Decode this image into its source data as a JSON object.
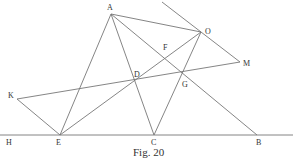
{
  "figure": {
    "caption": "Fig. 20",
    "points": [
      {
        "name": "A",
        "x": 111,
        "y": 14,
        "lx": 107,
        "ly": 10
      },
      {
        "name": "O",
        "x": 201,
        "y": 32,
        "lx": 205,
        "ly": 34
      },
      {
        "name": "F",
        "x": 166,
        "y": 52,
        "lx": 163,
        "ly": 50
      },
      {
        "name": "M",
        "x": 240,
        "y": 62,
        "lx": 243,
        "ly": 66
      },
      {
        "name": "D",
        "x": 135,
        "y": 80,
        "lx": 134,
        "ly": 77
      },
      {
        "name": "G",
        "x": 185,
        "y": 75,
        "lx": 182,
        "ly": 87
      },
      {
        "name": "K",
        "x": 17,
        "y": 99,
        "lx": 8,
        "ly": 98
      },
      {
        "name": "E",
        "x": 60,
        "y": 135,
        "lx": 56,
        "ly": 145
      },
      {
        "name": "C",
        "x": 154,
        "y": 135,
        "lx": 151,
        "ly": 145
      },
      {
        "name": "B",
        "x": 257,
        "y": 135,
        "lx": 256,
        "ly": 145
      },
      {
        "name": "H",
        "x": 8,
        "y": 135,
        "lx": 6,
        "ly": 145
      }
    ],
    "segments": [
      [
        "H-end",
        "R-end"
      ],
      [
        "A",
        "E"
      ],
      [
        "A",
        "C"
      ],
      [
        "A",
        "O"
      ],
      [
        "A",
        "B"
      ],
      [
        "O",
        "E"
      ],
      [
        "O",
        "C"
      ],
      [
        "K",
        "E"
      ],
      [
        "K",
        "M"
      ],
      [
        "X",
        "M"
      ]
    ]
  }
}
